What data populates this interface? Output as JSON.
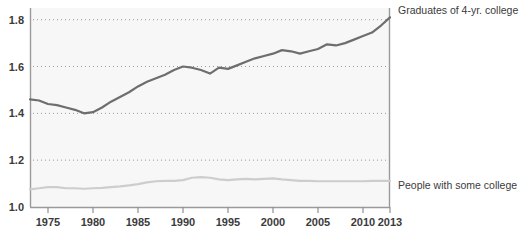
{
  "chart_data": {
    "type": "line",
    "title": "",
    "subtitle": "",
    "xlabel": "",
    "ylabel": "",
    "xlim": [
      1973,
      2013
    ],
    "ylim": [
      1.0,
      1.85
    ],
    "grid": true,
    "legend_position": "right-inline",
    "y_ticks": [
      "1.0",
      "1.2",
      "1.4",
      "1.6",
      "1.8"
    ],
    "y_tick_values": [
      1.0,
      1.2,
      1.4,
      1.6,
      1.8
    ],
    "x_ticks": [
      "1975",
      "1980",
      "1985",
      "1990",
      "1995",
      "2000",
      "2005",
      "2010",
      "2013"
    ],
    "x_tick_values": [
      1975,
      1980,
      1985,
      1990,
      1995,
      2000,
      2005,
      2010,
      2013
    ],
    "x": [
      1973,
      1974,
      1975,
      1976,
      1977,
      1978,
      1979,
      1980,
      1981,
      1982,
      1983,
      1984,
      1985,
      1986,
      1987,
      1988,
      1989,
      1990,
      1991,
      1992,
      1993,
      1994,
      1995,
      1996,
      1997,
      1998,
      1999,
      2000,
      2001,
      2002,
      2003,
      2004,
      2005,
      2006,
      2007,
      2008,
      2009,
      2010,
      2011,
      2012,
      2013
    ],
    "series": [
      {
        "name": "Graduates of 4-yr. college",
        "label": "Graduates of 4-yr. college",
        "color": "#6e6e6e",
        "values": [
          1.46,
          1.455,
          1.44,
          1.435,
          1.425,
          1.415,
          1.4,
          1.405,
          1.425,
          1.45,
          1.47,
          1.49,
          1.515,
          1.535,
          1.55,
          1.565,
          1.585,
          1.6,
          1.595,
          1.585,
          1.57,
          1.595,
          1.59,
          1.605,
          1.62,
          1.635,
          1.645,
          1.655,
          1.67,
          1.665,
          1.655,
          1.665,
          1.675,
          1.695,
          1.69,
          1.7,
          1.715,
          1.73,
          1.745,
          1.775,
          1.81
        ]
      },
      {
        "name": "People with some college",
        "label": "People with some college",
        "color": "#cdcdcd",
        "values": [
          1.075,
          1.08,
          1.085,
          1.085,
          1.08,
          1.08,
          1.078,
          1.08,
          1.082,
          1.085,
          1.088,
          1.092,
          1.098,
          1.105,
          1.11,
          1.112,
          1.112,
          1.115,
          1.125,
          1.128,
          1.125,
          1.118,
          1.115,
          1.118,
          1.12,
          1.118,
          1.12,
          1.122,
          1.118,
          1.115,
          1.112,
          1.112,
          1.11,
          1.11,
          1.11,
          1.11,
          1.11,
          1.11,
          1.112,
          1.112,
          1.112
        ]
      }
    ]
  },
  "labels": {
    "top_series_label": "Graduates of 4-yr. college",
    "bottom_series_label": "People with some college"
  }
}
